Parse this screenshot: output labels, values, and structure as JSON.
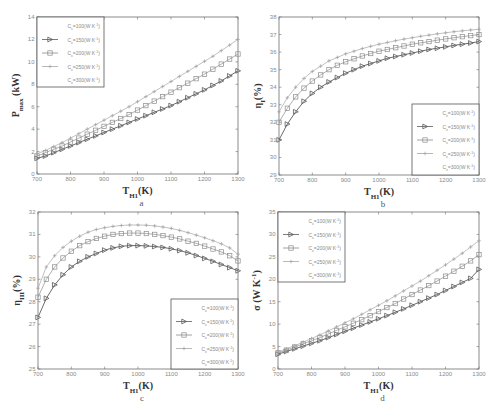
{
  "figure": {
    "panels": [
      "a",
      "b",
      "c",
      "d"
    ]
  },
  "legend_entries": [
    "C_x=100(W K^-1)",
    "C_x=150(W K^-1)",
    "C_x=200(W K^-1)",
    "C_x=250(W K^-1)",
    "C_x=300(W K^-1)"
  ],
  "colors": {
    "axis": "#6e6e6e",
    "c150": "#5a5a5a",
    "c200": "#8c8c8c",
    "c250": "#a6a6a6",
    "text": "#333333"
  },
  "chart_data": [
    {
      "id": "a",
      "type": "line",
      "panel_label": "a",
      "title": "",
      "xlabel": "T_H1(K)",
      "ylabel": "P_max (kW)",
      "xlim": [
        700,
        1300
      ],
      "ylim": [
        0,
        14
      ],
      "xticks": [
        700,
        800,
        900,
        1000,
        1100,
        1200,
        1300
      ],
      "yticks": [
        0,
        2,
        4,
        6,
        8,
        10,
        12,
        14
      ],
      "grid": false,
      "legend_position": "upper left",
      "box": {
        "x0": 37,
        "x1": 238,
        "y0": 17,
        "y1": 174
      },
      "legend_box": {
        "x": 37,
        "y": 17,
        "w": 67,
        "h": 70
      },
      "x": [
        700,
        725,
        750,
        775,
        800,
        825,
        850,
        875,
        900,
        925,
        950,
        975,
        1000,
        1025,
        1050,
        1075,
        1100,
        1125,
        1150,
        1175,
        1200,
        1225,
        1250,
        1275,
        1300
      ],
      "series": [
        {
          "name": "C_x=150(W K^-1)",
          "marker": "triangle-right",
          "values": [
            1.4,
            1.6,
            1.9,
            2.2,
            2.5,
            2.8,
            3.1,
            3.4,
            3.7,
            4.0,
            4.3,
            4.6,
            4.9,
            5.2,
            5.5,
            5.8,
            6.1,
            6.45,
            6.8,
            7.15,
            7.5,
            7.9,
            8.3,
            8.75,
            9.2
          ]
        },
        {
          "name": "C_x=200(W K^-1)",
          "marker": "square",
          "values": [
            1.6,
            1.9,
            2.2,
            2.5,
            2.85,
            3.2,
            3.55,
            3.9,
            4.25,
            4.6,
            4.95,
            5.3,
            5.7,
            6.1,
            6.5,
            6.9,
            7.3,
            7.7,
            8.1,
            8.5,
            8.9,
            9.35,
            9.8,
            10.25,
            10.7
          ]
        },
        {
          "name": "C_x=250(W K^-1)",
          "marker": "plus",
          "values": [
            1.8,
            2.1,
            2.45,
            2.8,
            3.2,
            3.6,
            4.0,
            4.4,
            4.8,
            5.2,
            5.6,
            6.0,
            6.45,
            6.9,
            7.35,
            7.8,
            8.25,
            8.7,
            9.15,
            9.6,
            10.05,
            10.5,
            11.0,
            11.5,
            12.0
          ]
        }
      ]
    },
    {
      "id": "b",
      "type": "line",
      "panel_label": "b",
      "title": "",
      "xlabel": "T_H1(K)",
      "ylabel": "η_I(%)",
      "xlim": [
        700,
        1300
      ],
      "ylim": [
        29,
        38
      ],
      "xticks": [
        700,
        800,
        900,
        1000,
        1100,
        1200,
        1300
      ],
      "yticks": [
        29,
        30,
        31,
        32,
        33,
        34,
        35,
        36,
        37,
        38
      ],
      "grid": false,
      "legend_position": "lower right",
      "box": {
        "x0": 279,
        "x1": 479,
        "y0": 17,
        "y1": 175
      },
      "legend_box": {
        "x": 412,
        "y": 104,
        "w": 67,
        "h": 71
      },
      "x": [
        700,
        725,
        750,
        775,
        800,
        825,
        850,
        875,
        900,
        925,
        950,
        975,
        1000,
        1025,
        1050,
        1075,
        1100,
        1125,
        1150,
        1175,
        1200,
        1225,
        1250,
        1275,
        1300
      ],
      "series": [
        {
          "name": "C_x=150(W K^-1)",
          "marker": "triangle-right",
          "values": [
            31.0,
            31.9,
            32.6,
            33.2,
            33.65,
            34.0,
            34.3,
            34.55,
            34.8,
            35.0,
            35.2,
            35.35,
            35.5,
            35.65,
            35.75,
            35.85,
            35.95,
            36.05,
            36.15,
            36.22,
            36.3,
            36.38,
            36.45,
            36.52,
            36.6
          ]
        },
        {
          "name": "C_x=200(W K^-1)",
          "marker": "square",
          "values": [
            32.0,
            32.8,
            33.45,
            33.95,
            34.35,
            34.7,
            35.0,
            35.25,
            35.45,
            35.62,
            35.78,
            35.92,
            36.05,
            36.15,
            36.25,
            36.35,
            36.45,
            36.53,
            36.6,
            36.68,
            36.75,
            36.82,
            36.88,
            36.94,
            37.0
          ]
        },
        {
          "name": "C_x=250(W K^-1)",
          "marker": "plus",
          "values": [
            32.6,
            33.4,
            34.0,
            34.5,
            34.9,
            35.2,
            35.5,
            35.7,
            35.9,
            36.05,
            36.2,
            36.33,
            36.45,
            36.55,
            36.65,
            36.74,
            36.82,
            36.9,
            36.97,
            37.04,
            37.1,
            37.16,
            37.21,
            37.26,
            37.3
          ]
        }
      ]
    },
    {
      "id": "c",
      "type": "line",
      "panel_label": "c",
      "title": "",
      "xlabel": "T_H1(K)",
      "ylabel": "η_III(%)",
      "xlim": [
        700,
        1300
      ],
      "ylim": [
        25,
        32
      ],
      "xticks": [
        700,
        800,
        900,
        1000,
        1100,
        1200,
        1300
      ],
      "yticks": [
        25,
        26,
        27,
        28,
        29,
        30,
        31,
        32
      ],
      "grid": false,
      "legend_position": "lower right",
      "box": {
        "x0": 38,
        "x1": 238,
        "y0": 212,
        "y1": 369
      },
      "legend_box": {
        "x": 171,
        "y": 299,
        "w": 67,
        "h": 70
      },
      "x": [
        700,
        725,
        750,
        775,
        800,
        825,
        850,
        875,
        900,
        925,
        950,
        975,
        1000,
        1025,
        1050,
        1075,
        1100,
        1125,
        1150,
        1175,
        1200,
        1225,
        1250,
        1275,
        1300
      ],
      "series": [
        {
          "name": "C_x=150(W K^-1)",
          "marker": "triangle-right",
          "values": [
            27.3,
            28.15,
            28.75,
            29.2,
            29.55,
            29.8,
            30.0,
            30.15,
            30.3,
            30.4,
            30.47,
            30.5,
            30.5,
            30.49,
            30.46,
            30.42,
            30.36,
            30.28,
            30.18,
            30.06,
            29.93,
            29.8,
            29.66,
            29.52,
            29.38
          ]
        },
        {
          "name": "C_x=200(W K^-1)",
          "marker": "square",
          "values": [
            28.2,
            29.0,
            29.55,
            29.95,
            30.25,
            30.5,
            30.68,
            30.82,
            30.92,
            31.0,
            31.04,
            31.06,
            31.06,
            31.04,
            31.0,
            30.95,
            30.88,
            30.8,
            30.7,
            30.6,
            30.48,
            30.35,
            30.22,
            30.05,
            29.82
          ]
        },
        {
          "name": "C_x=250(W K^-1)",
          "marker": "plus",
          "values": [
            28.6,
            29.55,
            30.05,
            30.42,
            30.7,
            30.92,
            31.1,
            31.22,
            31.3,
            31.36,
            31.4,
            31.42,
            31.42,
            31.41,
            31.38,
            31.33,
            31.27,
            31.18,
            31.08,
            30.97,
            30.85,
            30.72,
            30.58,
            30.4,
            30.12
          ]
        }
      ]
    },
    {
      "id": "d",
      "type": "line",
      "panel_label": "d",
      "title": "",
      "xlabel": "T_H1(K)",
      "ylabel": "σ (W K^-1)",
      "xlim": [
        700,
        1300
      ],
      "ylim": [
        0,
        35
      ],
      "xticks": [
        700,
        800,
        900,
        1000,
        1100,
        1200,
        1300
      ],
      "yticks": [
        0,
        5,
        10,
        15,
        20,
        25,
        30,
        35
      ],
      "grid": false,
      "legend_position": "upper left",
      "box": {
        "x0": 278,
        "x1": 479,
        "y0": 212,
        "y1": 369
      },
      "legend_box": {
        "x": 278,
        "y": 212,
        "w": 67,
        "h": 70
      },
      "x": [
        700,
        725,
        750,
        775,
        800,
        825,
        850,
        875,
        900,
        925,
        950,
        975,
        1000,
        1025,
        1050,
        1075,
        1100,
        1125,
        1150,
        1175,
        1200,
        1225,
        1250,
        1275,
        1300
      ],
      "series": [
        {
          "name": "C_x=150(W K^-1)",
          "marker": "triangle-right",
          "values": [
            3.3,
            3.9,
            4.5,
            5.1,
            5.7,
            6.3,
            7.0,
            7.7,
            8.4,
            9.1,
            9.8,
            10.5,
            11.2,
            11.9,
            12.65,
            13.4,
            14.2,
            15.0,
            15.8,
            16.6,
            17.5,
            18.4,
            19.3,
            20.2,
            22.2
          ]
        },
        {
          "name": "C_x=200(W K^-1)",
          "marker": "square",
          "values": [
            3.6,
            4.2,
            4.9,
            5.6,
            6.3,
            7.0,
            7.8,
            8.6,
            9.4,
            10.2,
            11.0,
            11.9,
            12.8,
            13.7,
            14.6,
            15.6,
            16.6,
            17.6,
            18.6,
            19.6,
            20.7,
            21.8,
            22.9,
            24.1,
            25.5
          ]
        },
        {
          "name": "C_x=250(W K^-1)",
          "marker": "plus",
          "values": [
            3.8,
            4.5,
            5.2,
            6.0,
            6.8,
            7.6,
            8.5,
            9.4,
            10.3,
            11.2,
            12.2,
            13.2,
            14.2,
            15.2,
            16.3,
            17.4,
            18.5,
            19.6,
            20.8,
            22.0,
            23.2,
            24.5,
            25.8,
            27.2,
            28.6
          ]
        }
      ]
    }
  ]
}
